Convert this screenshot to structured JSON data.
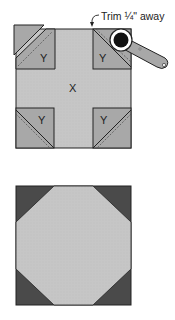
{
  "diagram": {
    "top_figure": {
      "center_label": "X",
      "corner_labels": [
        "Y",
        "Y",
        "Y",
        "Y"
      ],
      "annotation": "Trim ¼\" away",
      "tool": "rotary-cutter-icon"
    },
    "bottom_figure": {
      "description": "finished snowball block"
    },
    "colors": {
      "light_fabric": "#c4c4c4",
      "mid_fabric": "#a8a8a8",
      "dark_fabric": "#4a4a4a",
      "outline": "#222222"
    }
  }
}
